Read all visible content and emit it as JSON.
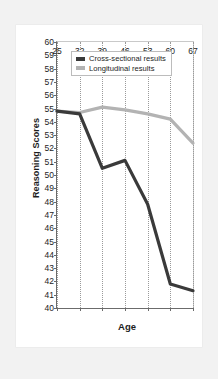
{
  "figure": {
    "background_color": "#f2f2f2",
    "card_color": "#ffffff"
  },
  "chart_data": {
    "type": "line",
    "title": "",
    "xlabel": "Age",
    "ylabel": "Reasoning Scores",
    "categories": [
      "25",
      "32",
      "39",
      "46",
      "53",
      "60",
      "67"
    ],
    "x": [
      25,
      32,
      39,
      46,
      53,
      60,
      67
    ],
    "xlim": [
      25,
      67
    ],
    "ylim": [
      40,
      60
    ],
    "ytick_labels": [
      "60",
      "59",
      "58",
      "57",
      "56",
      "55",
      "54",
      "53",
      "52",
      "51",
      "50",
      "49",
      "48",
      "47",
      "46",
      "45",
      "44",
      "43",
      "42",
      "41",
      "40"
    ],
    "ytick_values": [
      60,
      59,
      58,
      57,
      56,
      55,
      54,
      53,
      52,
      51,
      50,
      49,
      48,
      47,
      46,
      45,
      44,
      43,
      42,
      41,
      40
    ],
    "ytick_step": 1,
    "grid": "vertical-dotted",
    "legend_position": "upper-left-inside",
    "series": [
      {
        "name": "Cross-sectional results",
        "color": "#3a3a3a",
        "values": [
          54.8,
          54.6,
          50.5,
          51.1,
          47.8,
          41.8,
          41.3
        ]
      },
      {
        "name": "Longitudinal results",
        "color": "#b3b3b3",
        "values": [
          54.8,
          54.7,
          55.1,
          54.9,
          54.6,
          54.2,
          52.4
        ]
      }
    ]
  },
  "legend": {
    "entries": [
      {
        "label": "Cross-sectional results",
        "color": "#3a3a3a"
      },
      {
        "label": "Longitudinal results",
        "color": "#b3b3b3"
      }
    ]
  },
  "caption": {
    "text": ""
  }
}
